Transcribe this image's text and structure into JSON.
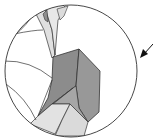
{
  "diagram": {
    "type": "magnified-detail-view",
    "colors": {
      "background": "#ffffff",
      "outline": "#333333",
      "dark_facet": "#8a8a8a",
      "mid_facet": "#9a9a9a",
      "light_facet": "#d9d9d9",
      "pale_facet": "#e6e6e6",
      "arrow": "#111111"
    },
    "callout": {
      "shape": "circle",
      "center": [
        71,
        71
      ],
      "radius": 66
    },
    "pointer": {
      "icon": "arrow-pointing-down-left",
      "tip": [
        141,
        58
      ],
      "tail": [
        153,
        44
      ]
    }
  }
}
